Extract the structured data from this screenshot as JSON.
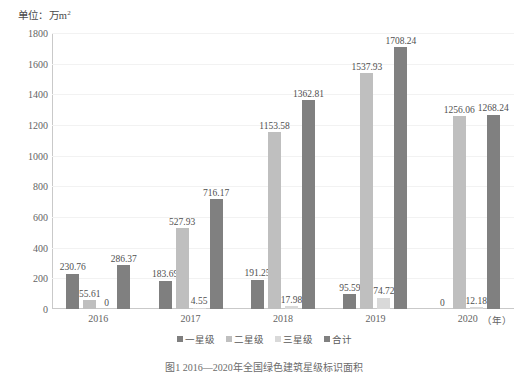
{
  "unit_label": {
    "prefix": "单位：万m",
    "superscript": "2",
    "full": "单位：万m²"
  },
  "caption": "图1 2016—2020年全国绿色建筑星级标识面积",
  "x_axis": {
    "unit": "（年）",
    "categories": [
      "2016",
      "2017",
      "2018",
      "2019",
      "2020"
    ]
  },
  "y_axis": {
    "ticks": [
      "0",
      "200",
      "400",
      "600",
      "800",
      "1000",
      "1200",
      "1400",
      "1600",
      "1800"
    ],
    "min": 0,
    "max": 1800,
    "step": 200
  },
  "legend": {
    "items": [
      {
        "label": "一星级",
        "color": "#7f7f7f"
      },
      {
        "label": "二星级",
        "color": "#bfbfbf"
      },
      {
        "label": "三星级",
        "color": "#d9d9d9"
      },
      {
        "label": "合计",
        "color": "#808080"
      }
    ]
  },
  "colors": {
    "series_1": "#7f7f7f",
    "series_2": "#bfbfbf",
    "series_3": "#d9d9d9",
    "series_4": "#808080",
    "grid": "#f2f2f2",
    "axis": "#c9c9c9",
    "text": "#595959"
  },
  "chart_data": {
    "type": "bar",
    "title": "",
    "subtitle": "",
    "xlabel": "（年）",
    "ylabel": "单位：万m²",
    "ylim": [
      0,
      1800
    ],
    "grid": true,
    "legend_position": "bottom-center",
    "categories": [
      "2016",
      "2017",
      "2018",
      "2019",
      "2020"
    ],
    "series": [
      {
        "name": "一星级",
        "color": "#7f7f7f",
        "values": [
          230.76,
          183.69,
          191.25,
          95.59,
          0
        ],
        "labels": [
          "230.76",
          "183.69",
          "191.25",
          "95.59",
          "0"
        ]
      },
      {
        "name": "二星级",
        "color": "#bfbfbf",
        "values": [
          55.61,
          527.93,
          1153.58,
          1537.93,
          1256.06
        ],
        "labels": [
          "55.61",
          "527.93",
          "1153.58",
          "1537.93",
          "1256.06"
        ]
      },
      {
        "name": "三星级",
        "color": "#d9d9d9",
        "values": [
          0,
          4.55,
          17.98,
          74.72,
          12.18
        ],
        "labels": [
          "0",
          "4.55",
          "17.98",
          "74.72",
          "12.18"
        ]
      },
      {
        "name": "合计",
        "color": "#808080",
        "values": [
          286.37,
          716.17,
          1362.81,
          1708.24,
          1268.24
        ],
        "labels": [
          "286.37",
          "716.17",
          "1362.81",
          "1708.24",
          "1268.24"
        ]
      }
    ]
  }
}
